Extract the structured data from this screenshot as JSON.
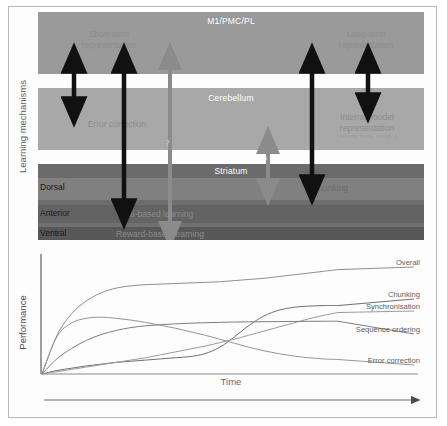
{
  "figure": {
    "panel_a": {
      "axis_label": "Learning mechanisms",
      "bands": [
        {
          "name": "M1/PMC/PL",
          "label": "M1/PMC/PL"
        },
        {
          "name": "Cerebellum",
          "label": "Cerebellum"
        },
        {
          "name": "Striatum",
          "label": "Striatum"
        }
      ],
      "striatum_subdivisions": [
        {
          "label": "Dorsal"
        },
        {
          "label": "Anterior"
        },
        {
          "label": "Ventral"
        }
      ],
      "annotations": [
        {
          "id": "short-term",
          "label": "Short-term",
          "label2": "representation"
        },
        {
          "id": "long-term",
          "label": "Long-term",
          "label2": "representation"
        },
        {
          "id": "error-correction",
          "label": "Error correction"
        },
        {
          "id": "internal-model",
          "label": "Internal model",
          "label2": "representation",
          "label3": "(velocity, force, timing...)"
        },
        {
          "id": "chunking",
          "label": "Chunking"
        },
        {
          "id": "goal-based",
          "label": "Goal-based learning"
        },
        {
          "id": "reward-based",
          "label": "Reward-based learning"
        }
      ],
      "question_marks": [
        {
          "id": "q-left",
          "label": "?"
        },
        {
          "id": "q-right",
          "label": "?"
        }
      ],
      "colors": {
        "m1_band": "#9a9a9a",
        "cerebellum_band": "#a8a8a8",
        "striatum_header": "#6b6b6b",
        "striatum_dorsal": "#808080",
        "striatum_anterior": "#636363",
        "striatum_ventral": "#585858",
        "black_arrow": "#111111",
        "gray_arrow": "#8b8b8b",
        "text_on_band": "#ffffff",
        "text_gray": "#8d8d8d"
      }
    },
    "panel_b": {
      "ylabel": "Performance",
      "xlabel": "Time"
    }
  },
  "chart_data": {
    "type": "line",
    "title": "",
    "xlabel": "Time",
    "ylabel": "Performance",
    "xlim": [
      0,
      100
    ],
    "ylim": [
      0,
      100
    ],
    "grid": false,
    "legend_position": "right-inline",
    "axis_ticks": {
      "x": [],
      "y": []
    },
    "x": [
      0,
      5,
      10,
      15,
      20,
      25,
      30,
      35,
      40,
      45,
      50,
      55,
      60,
      65,
      70,
      75,
      80,
      85,
      90,
      95,
      100
    ],
    "series": [
      {
        "name": "Overall",
        "color": "#8f8f8f",
        "values": [
          0,
          33,
          52,
          63,
          70,
          74,
          76,
          77,
          77.5,
          78,
          78.5,
          79,
          79.5,
          80.5,
          81.5,
          82.5,
          84,
          85.5,
          87,
          88.5,
          90
        ]
      },
      {
        "name": "Chunking",
        "color": "#707070",
        "values": [
          0,
          3,
          5,
          7,
          8.5,
          10,
          11,
          12,
          13,
          14,
          15,
          17.5,
          23,
          32,
          42,
          50,
          55,
          57.5,
          58.5,
          59,
          59
        ]
      },
      {
        "name": "Synchronisation",
        "color": "#9c9c9c",
        "values": [
          0,
          2,
          4,
          6,
          8,
          10,
          12,
          14,
          16.5,
          19,
          21.5,
          24,
          27,
          30,
          33.5,
          37,
          40.5,
          44,
          47.5,
          50.5,
          53
        ]
      },
      {
        "name": "Sequence ordering",
        "color": "#7d7d7d",
        "values": [
          0,
          13,
          22,
          29,
          34,
          37.5,
          40,
          41.5,
          42.5,
          43.2,
          43.8,
          44.2,
          44.5,
          44.8,
          45,
          45.1,
          45.2,
          45.3,
          45.4,
          45.5,
          45.5
        ]
      },
      {
        "name": "Error correction",
        "color": "#959595",
        "values": [
          0,
          32,
          44,
          48,
          49,
          48,
          46.5,
          44.5,
          42,
          39.5,
          36.5,
          33.5,
          30,
          26.5,
          23,
          20,
          17.5,
          15.5,
          14,
          13,
          12.5
        ]
      }
    ]
  }
}
